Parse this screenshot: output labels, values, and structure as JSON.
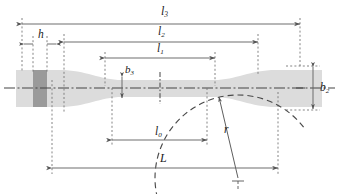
{
  "figure": {
    "type": "engineering-dimension-diagram",
    "background_color": "#ffffff",
    "line_color": "#555555",
    "body_fill": "#dcdcdc",
    "block_fill": "#9a9a9a"
  },
  "labels": {
    "l3": {
      "base": "l",
      "sub": "3",
      "text": "l3"
    },
    "l2": {
      "base": "l",
      "sub": "2",
      "text": "l2"
    },
    "l1": {
      "base": "l",
      "sub": "1",
      "text": "l1"
    },
    "l0": {
      "base": "l",
      "sub": "0",
      "text": "l0"
    },
    "h": {
      "base": "h",
      "sub": "",
      "text": "h"
    },
    "L": {
      "base": "L",
      "sub": "",
      "text": "L"
    },
    "r": {
      "base": "r",
      "sub": "",
      "text": "r"
    },
    "b3": {
      "base": "b",
      "sub": "3",
      "text": "b3"
    },
    "b2": {
      "base": "b",
      "sub": "2",
      "text": "b2"
    }
  },
  "dimensions": [
    {
      "name": "l3",
      "orientation": "horizontal",
      "x1": 22,
      "x2": 300,
      "y": 24,
      "label": "l3"
    },
    {
      "name": "l2",
      "orientation": "horizontal",
      "x1": 64,
      "x2": 258,
      "y": 42,
      "label": "l2"
    },
    {
      "name": "l1",
      "orientation": "horizontal",
      "x1": 105,
      "x2": 215,
      "y": 58,
      "label": "l1"
    },
    {
      "name": "h",
      "orientation": "horizontal",
      "x1": 33,
      "x2": 47,
      "y": 44,
      "label": "h"
    },
    {
      "name": "l0",
      "orientation": "horizontal",
      "x1": 112,
      "x2": 207,
      "y": 140,
      "label": "l0"
    },
    {
      "name": "L",
      "orientation": "horizontal",
      "x1": 52,
      "x2": 278,
      "y": 168,
      "label": "L"
    },
    {
      "name": "b3",
      "orientation": "vertical",
      "y1": 77,
      "y2": 98,
      "x": 122,
      "label": "b3"
    },
    {
      "name": "b2",
      "orientation": "vertical",
      "y1": 70,
      "y2": 107,
      "x": 313,
      "label": "b2"
    }
  ],
  "arc": {
    "name": "radius-arc",
    "center_x": 238,
    "center_y": 178,
    "radius": 83,
    "label": "r"
  },
  "centerline": {
    "y": 88,
    "x1": 4,
    "x2": 335,
    "style": "dash-dot"
  }
}
